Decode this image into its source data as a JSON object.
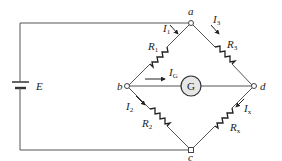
{
  "diagram": {
    "source": {
      "label": "E"
    },
    "nodes": [
      {
        "id": "a",
        "label": "a"
      },
      {
        "id": "b",
        "label": "b"
      },
      {
        "id": "c",
        "label": "c"
      },
      {
        "id": "d",
        "label": "d"
      }
    ],
    "resistors": [
      {
        "id": "R1",
        "label": "R",
        "sub": "1",
        "from": "a",
        "to": "b"
      },
      {
        "id": "R3",
        "label": "R",
        "sub": "3",
        "from": "a",
        "to": "d"
      },
      {
        "id": "R2",
        "label": "R",
        "sub": "2",
        "from": "b",
        "to": "c"
      },
      {
        "id": "Rx",
        "label": "R",
        "sub": "x",
        "from": "d",
        "to": "c"
      }
    ],
    "galvanometer": {
      "label": "G",
      "from": "b",
      "to": "d",
      "fill": "#e6e6e6"
    },
    "currents": [
      {
        "id": "I1",
        "label": "I",
        "sub": "1"
      },
      {
        "id": "I3",
        "label": "I",
        "sub": "3"
      },
      {
        "id": "I2",
        "label": "I",
        "sub": "2"
      },
      {
        "id": "Ix",
        "label": "I",
        "sub": "x"
      },
      {
        "id": "IG",
        "label": "I",
        "sub": "G"
      }
    ]
  }
}
